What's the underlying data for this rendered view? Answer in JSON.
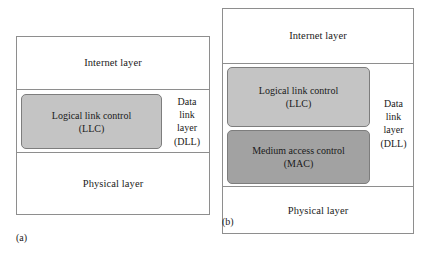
{
  "figure": {
    "type": "layered-protocol-stack-comparison",
    "panels": [
      {
        "caption": "(a)",
        "layers": [
          {
            "label": "Internet layer"
          },
          {
            "label": "Data link layer (DLL)",
            "side_label_lines": "Data\nlink\nlayer\n(DLL)"
          },
          {
            "label": "Physical layer"
          }
        ],
        "sublayers": [
          {
            "name": "logical-link-control",
            "label": "Logical link control\n(LLC)",
            "fill": "#c4c4c4"
          }
        ]
      },
      {
        "caption": "(b)",
        "layers": [
          {
            "label": "Internet layer"
          },
          {
            "label": "Data link layer (DLL)",
            "side_label_lines": "Data\nlink\nlayer\n(DLL)"
          },
          {
            "label": "Physical layer"
          }
        ],
        "sublayers": [
          {
            "name": "logical-link-control",
            "label": "Logical link control\n(LLC)",
            "fill": "#c4c4c4"
          },
          {
            "name": "medium-access-control",
            "label": "Medium access control\n(MAC)",
            "fill": "#a2a2a2"
          }
        ]
      }
    ]
  },
  "panel_a": {
    "internet_layer": "Internet layer",
    "physical_layer": "Physical layer",
    "llc_line1": "Logical link control",
    "llc_line2": "(LLC)",
    "dll_line1": "Data",
    "dll_line2": "link",
    "dll_line3": "layer",
    "dll_line4": "(DLL)",
    "caption": "(a)"
  },
  "panel_b": {
    "internet_layer": "Internet layer",
    "physical_layer": "Physical layer",
    "llc_line1": "Logical link control",
    "llc_line2": "(LLC)",
    "mac_line1": "Medium access control",
    "mac_line2": "(MAC)",
    "dll_line1": "Data",
    "dll_line2": "link",
    "dll_line3": "layer",
    "dll_line4": "(DLL)",
    "caption": "(b)"
  },
  "colors": {
    "llc_fill": "#c4c4c4",
    "mac_fill": "#a2a2a2",
    "border": "#8e8e8e",
    "background": "#ffffff",
    "text": "#1a1a1a"
  }
}
